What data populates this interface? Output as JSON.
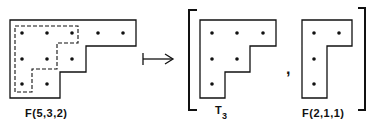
{
  "diagram": {
    "left_shape": {
      "label": "F(5,3,2)",
      "rows": [
        5,
        3,
        2
      ],
      "inner_dashed_rows": [
        3,
        2,
        1
      ]
    },
    "arrow": "maps-to",
    "result": {
      "first": {
        "label_main": "T",
        "label_sub": "3",
        "rows": [
          3,
          2,
          1
        ]
      },
      "separator": ",",
      "second": {
        "label": "F(2,1,1)",
        "rows": [
          2,
          1,
          1
        ]
      }
    },
    "colors": {
      "ink": "#111111",
      "background": "#ffffff"
    }
  }
}
